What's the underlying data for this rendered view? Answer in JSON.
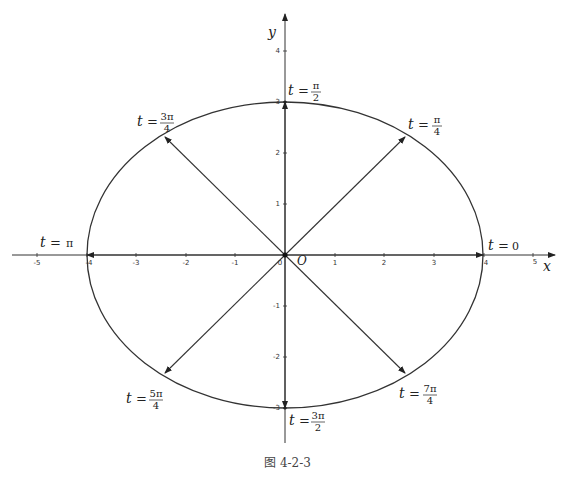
{
  "figure": {
    "caption": "图 4-2-3",
    "axis_x_label": "x",
    "axis_y_label": "y",
    "origin_label": "O",
    "x_ticks": [
      "-5",
      "-4",
      "-3",
      "-2",
      "-1",
      "0",
      "1",
      "2",
      "3",
      "4",
      "5"
    ],
    "y_ticks": [
      "4",
      "3",
      "2",
      "1",
      "-1",
      "-2",
      "-3"
    ],
    "ellipse": {
      "a": 4,
      "b": 3,
      "equation": "x = 4cos t, y = 3sin t"
    },
    "labels": {
      "t0": {
        "t": "t",
        "eq": "=",
        "val": "0"
      },
      "tpi4": {
        "t": "t",
        "eq": "=",
        "num": "π",
        "den": "4"
      },
      "tpi2": {
        "t": "t",
        "eq": "=",
        "num": "π",
        "den": "2"
      },
      "t3pi4": {
        "t": "t",
        "eq": "=",
        "num": "3π",
        "den": "4"
      },
      "tpi": {
        "t": "t",
        "eq": "=",
        "val": "π"
      },
      "t5pi4": {
        "t": "t",
        "eq": "=",
        "num": "5π",
        "den": "4"
      },
      "t3pi2": {
        "t": "t",
        "eq": "=",
        "num": "3π",
        "den": "2"
      },
      "t7pi4": {
        "t": "t",
        "eq": "=",
        "num": "7π",
        "den": "4"
      }
    }
  }
}
